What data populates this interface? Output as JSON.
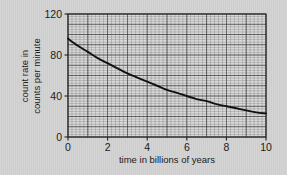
{
  "chart_data": {
    "type": "line",
    "title": "",
    "subtitle": "",
    "xlabel": "time in billions of years",
    "ylabel_line1": "count rate in",
    "ylabel_line2": "counts per minute",
    "xlim": [
      0,
      10
    ],
    "ylim": [
      0,
      120
    ],
    "xticks": [
      0,
      2,
      4,
      6,
      8,
      10
    ],
    "xtick_labels": [
      "0",
      "2",
      "4",
      "6",
      "8",
      "10"
    ],
    "yticks": [
      0,
      40,
      80,
      120
    ],
    "ytick_labels": [
      "0",
      "40",
      "80",
      "120"
    ],
    "x_minor_step": 0.2,
    "y_minor_step": 2.5,
    "grid": true,
    "legend": false,
    "series": [
      {
        "name": "count rate",
        "x": [
          0,
          0.5,
          1,
          1.5,
          2,
          2.5,
          3,
          3.5,
          4,
          4.5,
          5,
          5.5,
          6,
          6.5,
          7,
          7.5,
          8,
          8.5,
          9,
          9.5,
          10
        ],
        "values": [
          96,
          89,
          83,
          77,
          72,
          67,
          62,
          58,
          54,
          50,
          46,
          43,
          40,
          37,
          35,
          32,
          30,
          28,
          26,
          24,
          23
        ]
      }
    ],
    "line_color": "#111111",
    "grid_color": "#6e6e6e",
    "background": "#d3d3d3",
    "plot_background": "#d9d9d9"
  },
  "chart_meta": {
    "x_tick_count": 6,
    "y_tick_count": 4
  }
}
